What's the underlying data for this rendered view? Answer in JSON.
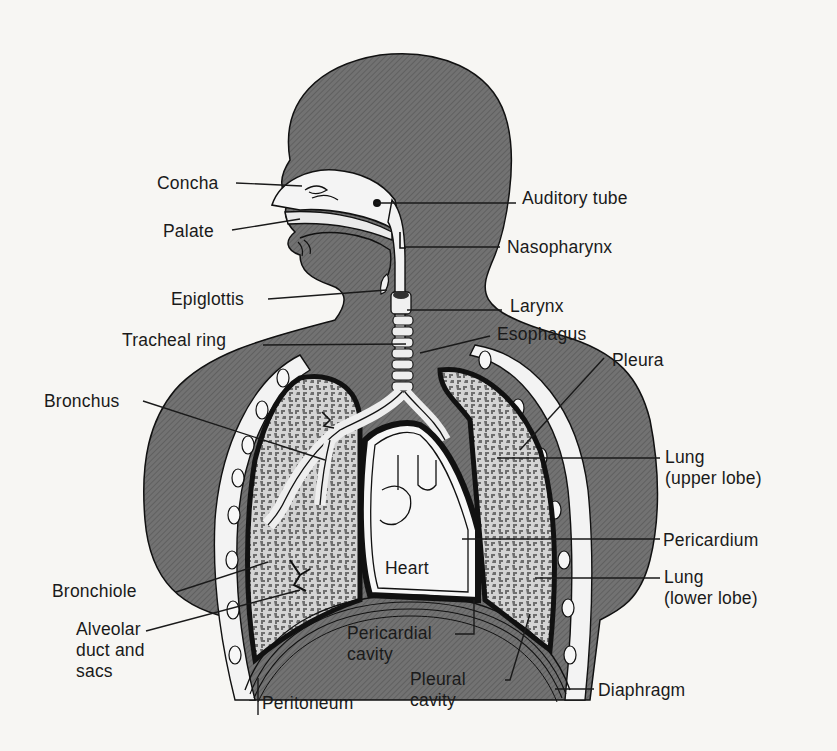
{
  "figure": {
    "colors": {
      "page": "#f7f6f3",
      "body_fill": "#6f6f6f",
      "body_hatch": "#5a5a5a",
      "outline": "#111111",
      "lung_fill": "#bdbdbd",
      "lung_spot": "#7a7a7a",
      "airway": "#f2f2f2",
      "heart": "#f5f5f5",
      "leader": "#1a1a1a"
    }
  },
  "labels": [
    {
      "id": "concha",
      "text": "Concha",
      "x": 157,
      "y": 173,
      "align": "left",
      "line": [
        [
          236,
          183
        ],
        [
          302,
          186
        ]
      ]
    },
    {
      "id": "palate",
      "text": "Palate",
      "x": 163,
      "y": 221,
      "align": "left",
      "line": [
        [
          232,
          230
        ],
        [
          300,
          219
        ]
      ]
    },
    {
      "id": "auditory-tube",
      "text": "Auditory tube",
      "x": 522,
      "y": 188,
      "align": "left",
      "line": [
        [
          376,
          203
        ],
        [
          516,
          203
        ]
      ]
    },
    {
      "id": "nasopharynx",
      "text": "Nasopharynx",
      "x": 507,
      "y": 237,
      "align": "left",
      "line": [
        [
          405,
          247
        ],
        [
          500,
          247
        ]
      ]
    },
    {
      "id": "epiglottis",
      "text": "Epiglottis",
      "x": 171,
      "y": 289,
      "align": "left",
      "line": [
        [
          268,
          299
        ],
        [
          387,
          290
        ]
      ]
    },
    {
      "id": "larynx",
      "text": "Larynx",
      "x": 510,
      "y": 296,
      "align": "left",
      "line": [
        [
          407,
          310
        ],
        [
          502,
          310
        ]
      ]
    },
    {
      "id": "tracheal-ring",
      "text": "Tracheal ring",
      "x": 122,
      "y": 330,
      "align": "left",
      "line": [
        [
          263,
          345
        ],
        [
          406,
          344
        ]
      ]
    },
    {
      "id": "esophagus",
      "text": "Esophagus",
      "x": 497,
      "y": 324,
      "align": "left",
      "line": [
        [
          420,
          353
        ],
        [
          490,
          336
        ]
      ]
    },
    {
      "id": "pleura",
      "text": "Pleura",
      "x": 612,
      "y": 350,
      "align": "left",
      "line": [
        [
          604,
          358
        ],
        [
          520,
          450
        ]
      ]
    },
    {
      "id": "bronchus",
      "text": "Bronchus",
      "x": 44,
      "y": 391,
      "align": "left",
      "line": [
        [
          143,
          401
        ],
        [
          325,
          460
        ]
      ]
    },
    {
      "id": "lung-upper-lobe",
      "text": "Lung\n(upper lobe)",
      "x": 665,
      "y": 447,
      "align": "left",
      "line": [
        [
          497,
          458
        ],
        [
          660,
          458
        ]
      ]
    },
    {
      "id": "heart",
      "text": "Heart",
      "x": 385,
      "y": 558,
      "align": "left",
      "line": null
    },
    {
      "id": "pericardium",
      "text": "Pericardium",
      "x": 663,
      "y": 530,
      "align": "left",
      "line": [
        [
          462,
          539
        ],
        [
          660,
          539
        ]
      ]
    },
    {
      "id": "lung-lower-lobe",
      "text": "Lung\n(lower lobe)",
      "x": 664,
      "y": 567,
      "align": "left",
      "line": [
        [
          535,
          578
        ],
        [
          660,
          578
        ]
      ]
    },
    {
      "id": "bronchiole",
      "text": "Bronchiole",
      "x": 52,
      "y": 581,
      "align": "left",
      "line": [
        [
          176,
          592
        ],
        [
          268,
          562
        ]
      ]
    },
    {
      "id": "alveolar-duct-and-sacs",
      "text": "Alveolar\nduct and\nsacs",
      "x": 76,
      "y": 619,
      "align": "left",
      "line": [
        [
          146,
          631
        ],
        [
          300,
          590
        ]
      ]
    },
    {
      "id": "pericardial-cavity",
      "text": "Pericardial\ncavity",
      "x": 347,
      "y": 623,
      "align": "left",
      "line": [
        [
          455,
          634
        ],
        [
          474,
          634
        ],
        [
          474,
          600
        ]
      ]
    },
    {
      "id": "pleural-cavity",
      "text": "Pleural\ncavity",
      "x": 410,
      "y": 669,
      "align": "left",
      "line": [
        [
          505,
          680
        ],
        [
          510,
          680
        ],
        [
          530,
          614
        ]
      ]
    },
    {
      "id": "diaphragm",
      "text": "Diaphragm",
      "x": 598,
      "y": 680,
      "align": "left",
      "line": [
        [
          555,
          689
        ],
        [
          594,
          689
        ]
      ]
    },
    {
      "id": "peritoneum",
      "text": "Peritoneum",
      "x": 262,
      "y": 693,
      "align": "left",
      "line": [
        [
          258,
          715
        ],
        [
          258,
          678
        ]
      ]
    }
  ]
}
